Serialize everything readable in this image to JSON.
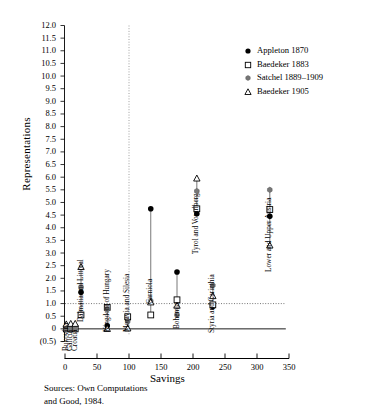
{
  "chart_data": {
    "type": "scatter",
    "title": "",
    "xlabel": "Savings",
    "ylabel": "Representations",
    "xlim": [
      -10,
      350
    ],
    "ylim": [
      -0.5,
      12.0
    ],
    "xticks": [
      0,
      50,
      100,
      150,
      200,
      250,
      300,
      350
    ],
    "yticks": [
      "12.0",
      "11.5",
      "11.0",
      "10.5",
      "10.0",
      "9.5",
      "9.0",
      "8.5",
      "8.0",
      "7.5",
      "7.0",
      "6.5",
      "6.0",
      "5.5",
      "5.0",
      "4.5",
      "4.0",
      "3.5",
      "3.0",
      "2.5",
      "2.0",
      "1.5",
      "1.0",
      "0.5",
      "0",
      "(0.5)"
    ],
    "ytick_values": [
      12.0,
      11.5,
      11.0,
      10.5,
      10.0,
      9.5,
      9.0,
      8.5,
      8.0,
      7.5,
      7.0,
      6.5,
      6.0,
      5.5,
      5.0,
      4.5,
      4.0,
      3.5,
      3.0,
      2.5,
      2.0,
      1.5,
      1.0,
      0.5,
      0,
      -0.5
    ],
    "grid": false,
    "reference_lines": [
      {
        "axis": "y",
        "value": 1.0,
        "style": "dotted"
      },
      {
        "axis": "x",
        "value": 100,
        "style": "dotted"
      },
      {
        "axis": "y",
        "value": 0,
        "style": "solid"
      }
    ],
    "legend_position": "top-right",
    "series": [
      {
        "name": "Appleton 1870",
        "marker": "filled-circle"
      },
      {
        "name": "Baedeker 1883",
        "marker": "open-square"
      },
      {
        "name": "Satchel 1889–1909",
        "marker": "star"
      },
      {
        "name": "Baedeker 1905",
        "marker": "open-triangle"
      }
    ],
    "groups": [
      {
        "label": "Bukovina",
        "x": 2,
        "label_y": -0.52,
        "values": {
          "Appleton 1870": 0.0,
          "Baedeker 1883": 0.0,
          "Satchel 1889–1909": 0.0,
          "Baedeker 1905": 0.18
        }
      },
      {
        "label": "Galicia",
        "x": 9,
        "label_y": -0.52,
        "values": {
          "Appleton 1870": 0.0,
          "Baedeker 1883": 0.0,
          "Satchel 1889–1909": 0.0,
          "Baedeker 1905": 0.2
        }
      },
      {
        "label": "Croatia",
        "x": 16,
        "label_y": -0.52,
        "values": {
          "Appleton 1870": 0.0,
          "Baedeker 1883": 0.0,
          "Satchel 1889–1909": 0.0,
          "Baedeker 1905": 0.2
        }
      },
      {
        "label": "Dalmatia and Littoral",
        "x": 25,
        "label_y": 0.62,
        "values": {
          "Appleton 1870": 1.45,
          "Baedeker 1883": 0.55,
          "Satchel 1889–1909": 1.65,
          "Baedeker 1905": 2.45
        }
      },
      {
        "label": "Kingdom of Hungary",
        "x": 66,
        "label_y": 0.25,
        "values": {
          "Appleton 1870": 0.12,
          "Baedeker 1883": 0.85,
          "Satchel 1889–1909": 0.78,
          "Baedeker 1905": 0.0
        }
      },
      {
        "label": "Moravia and Silesia",
        "x": 98,
        "label_y": 0.25,
        "values": {
          "Appleton 1870": 0.38,
          "Baedeker 1883": 0.48,
          "Satchel 1889–1909": 0.3,
          "Baedeker 1905": 0.02
        }
      },
      {
        "label": "Carniola",
        "x": 134,
        "label_y": 1.35,
        "values": {
          "Appleton 1870": 4.75,
          "Baedeker 1883": 0.55,
          "Satchel 1889–1909": 1.1,
          "Baedeker 1905": 1.05
        }
      },
      {
        "label": "Bohemia",
        "x": 175,
        "label_y": 0.35,
        "values": {
          "Appleton 1870": 2.25,
          "Baedeker 1883": 1.15,
          "Satchel 1889–1909": 0.55,
          "Baedeker 1905": 0.92
        }
      },
      {
        "label": "Tyrol and Vorarlberg",
        "x": 206,
        "label_y": 3.3,
        "values": {
          "Appleton 1870": 4.55,
          "Baedeker 1883": 4.75,
          "Satchel 1889–1909": 5.45,
          "Baedeker 1905": 5.95
        }
      },
      {
        "label": "Styria and Carinthia",
        "x": 231,
        "label_y": 0.2,
        "values": {
          "Appleton 1870": 0.88,
          "Baedeker 1883": 0.95,
          "Satchel 1889–1909": 1.72,
          "Baedeker 1905": 1.3
        }
      },
      {
        "label": "Lower and Upper Austria",
        "x": 320,
        "label_y": 2.6,
        "values": {
          "Appleton 1870": 4.45,
          "Baedeker 1883": 4.72,
          "Satchel 1889–1909": 5.5,
          "Baedeker 1905": 3.3
        }
      }
    ]
  },
  "legend": {
    "items": [
      {
        "label": "Appleton 1870",
        "marker": "filled-circle"
      },
      {
        "label": "Baedeker 1883",
        "marker": "open-square"
      },
      {
        "label": "Satchel 1889–1909",
        "marker": "star"
      },
      {
        "label": "Baedeker 1905",
        "marker": "open-triangle"
      }
    ]
  },
  "axes": {
    "ylabel": "Representations",
    "xlabel": "Savings"
  },
  "footer": {
    "source": "Sources:  Own Computations\nand Good, 1984."
  }
}
